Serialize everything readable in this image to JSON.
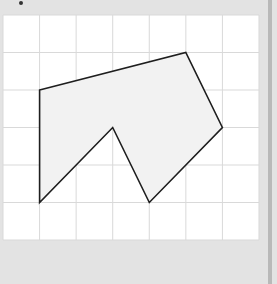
{
  "figure": {
    "grid": {
      "columns": 7,
      "rows": 6
    },
    "polygon": {
      "vertices": [
        [
          1,
          2
        ],
        [
          5,
          1
        ],
        [
          6,
          3
        ],
        [
          4,
          5
        ],
        [
          3,
          3
        ],
        [
          1,
          5
        ]
      ],
      "vertex_count": 6
    },
    "colors": {
      "background": "#e3e3e3",
      "panel": "#ffffff",
      "grid_line": "#d9d9d9",
      "polygon_fill": "#f2f2f2",
      "polygon_stroke": "#1e1e1e"
    }
  }
}
